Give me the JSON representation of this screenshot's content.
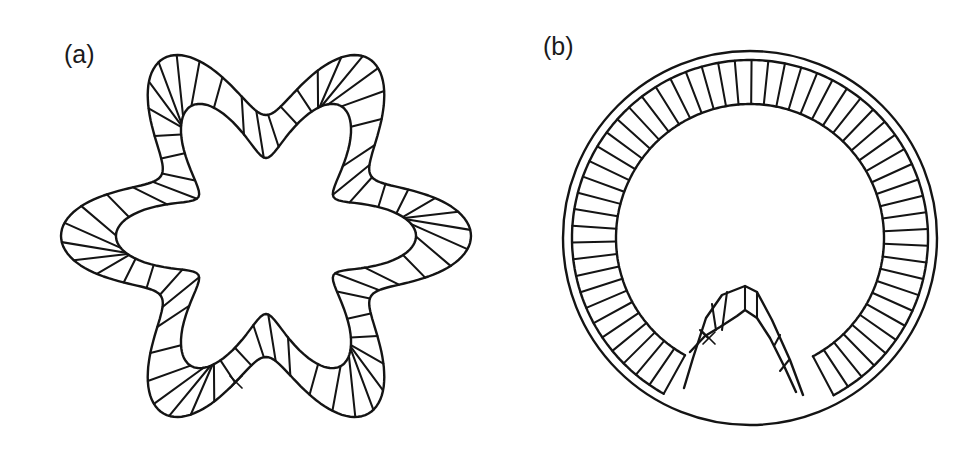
{
  "figure": {
    "panels": [
      {
        "id": "a",
        "label": "(a)",
        "description": "Six-lobed wavy ring cross-section with hatched wall and an x marker on the lower wall",
        "shape": {
          "center": [
            266,
            236
          ],
          "lobes": 6,
          "phase_deg": 0,
          "outer_base": 163,
          "outer_amp": 42,
          "inner_base": 114,
          "inner_amp": 36,
          "inner_twist_deg": 9,
          "hatch_count": 66,
          "stroke_color": "#141414",
          "stroke_width": 2.4
        },
        "marker": {
          "symbol": "x",
          "position": [
            236,
            382
          ]
        }
      },
      {
        "id": "b",
        "label": "(b)",
        "description": "Circular ring with outer double boundary, radially hatched band, and a folded inward arch at the bottom with an x marker",
        "shape": {
          "center": [
            750,
            238
          ],
          "outer_radius": 187,
          "second_radius": 178,
          "band_inner_radius": 134,
          "gap_start_deg": 62,
          "gap_end_deg": 119,
          "hatch_count": 56,
          "stroke_color": "#141414",
          "stroke_width": 2.4
        },
        "arch": {
          "outer": [
            [
              684,
              388
            ],
            [
              693,
              358
            ],
            [
              706,
              318
            ],
            [
              722,
              295
            ],
            [
              745,
              286
            ],
            [
              757,
              292
            ],
            [
              772,
              320
            ],
            [
              790,
              360
            ],
            [
              803,
              395
            ]
          ],
          "inner": [
            [
              690,
              352
            ],
            [
              705,
              336
            ],
            [
              720,
              327
            ],
            [
              737,
              316
            ],
            [
              745,
              310
            ],
            [
              757,
              318
            ],
            [
              770,
              338
            ],
            [
              785,
              368
            ],
            [
              796,
              392
            ]
          ],
          "hatches": [
            [
              [
                727,
                292
              ],
              [
                722,
                330
              ]
            ],
            [
              [
                745,
                286
              ],
              [
                745,
                310
              ]
            ],
            [
              [
                757,
                292
              ],
              [
                757,
                318
              ]
            ],
            [
              [
                780,
                335
              ],
              [
                774,
                346
              ]
            ],
            [
              [
                789,
                360
              ],
              [
                780,
                371
              ]
            ],
            [
              [
                700,
                330
              ],
              [
                708,
                338
              ]
            ],
            [
              [
                712,
                304
              ],
              [
                716,
                330
              ]
            ]
          ]
        },
        "marker": {
          "symbol": "x",
          "position": [
            709,
            338
          ]
        }
      }
    ]
  }
}
